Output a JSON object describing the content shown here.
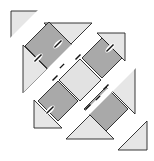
{
  "diagram": {
    "title": "",
    "colors": {
      "background": "#ffffff",
      "setting_triangle": "#e6e6e6",
      "dark_square": "#a9a9a9",
      "light_square": "#e2e2e2",
      "outline": "#222222",
      "seam_mark": "#111111"
    },
    "rows": [
      {
        "id": "row-1",
        "pieces": [
          "corner-triangle"
        ]
      },
      {
        "id": "row-2",
        "pieces": [
          "setting-triangle",
          "dark-square",
          "setting-triangle"
        ]
      },
      {
        "id": "row-3",
        "pieces": [
          "setting-triangle",
          "dark-square",
          "light-square",
          "dark-square",
          "setting-triangle"
        ]
      },
      {
        "id": "row-4",
        "pieces": [
          "setting-triangle",
          "dark-square",
          "setting-triangle"
        ]
      },
      {
        "id": "row-5",
        "pieces": [
          "corner-triangle"
        ]
      }
    ],
    "seam_marks": 10
  }
}
